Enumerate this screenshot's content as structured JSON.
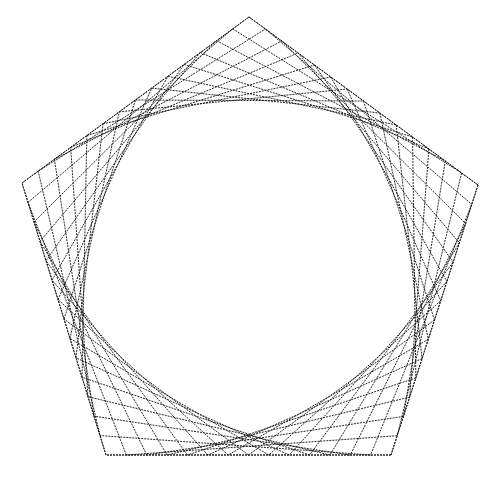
{
  "figure": {
    "type": "string-art",
    "shape": "pentagon",
    "vertices": [
      [
        249,
        17
      ],
      [
        478,
        185
      ],
      [
        391,
        455
      ],
      [
        106,
        455
      ],
      [
        22,
        183
      ]
    ],
    "lines_per_corner": 14,
    "stroke_color": "#111111",
    "background_color": "#ffffff"
  }
}
